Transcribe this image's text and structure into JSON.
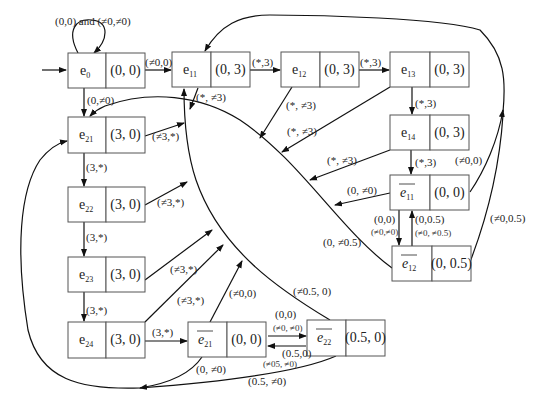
{
  "states": {
    "e0": {
      "name": "e",
      "sub": "0",
      "bar": false,
      "value": "(0, 0)"
    },
    "e11": {
      "name": "e",
      "sub": "11",
      "bar": false,
      "value": "(0, 3)"
    },
    "e12": {
      "name": "e",
      "sub": "12",
      "bar": false,
      "value": "(0, 3)"
    },
    "e13": {
      "name": "e",
      "sub": "13",
      "bar": false,
      "value": "(0, 3)"
    },
    "e14": {
      "name": "e",
      "sub": "14",
      "bar": false,
      "value": "(0, 3)"
    },
    "eb11": {
      "name": "e",
      "sub": "11",
      "bar": true,
      "value": "(0, 0)"
    },
    "eb12": {
      "name": "e",
      "sub": "12",
      "bar": true,
      "value": "(0, 0.5)"
    },
    "e21": {
      "name": "e",
      "sub": "21",
      "bar": false,
      "value": "(3, 0)"
    },
    "e22": {
      "name": "e",
      "sub": "22",
      "bar": false,
      "value": "(3, 0)"
    },
    "e23": {
      "name": "e",
      "sub": "23",
      "bar": false,
      "value": "(3, 0)"
    },
    "e24": {
      "name": "e",
      "sub": "24",
      "bar": false,
      "value": "(3, 0)"
    },
    "eb21": {
      "name": "e",
      "sub": "21",
      "bar": true,
      "value": "(0, 0)"
    },
    "eb22": {
      "name": "e",
      "sub": "22",
      "bar": true,
      "value": "(0.5, 0)"
    }
  },
  "edges": {
    "e0_self": "(0,0) and (≠0,≠0)",
    "e0_e11": "(≠0,0)",
    "e0_e21": "(0,≠0)",
    "e11_e12": "(*,3)",
    "e11_down": "(*, ≠3)",
    "e12_e13": "(*,3)",
    "e12_down": "(*, ≠3)",
    "e13_down": "(*, ≠3)",
    "e13_e14": "(*,3)",
    "e14_down": "(*, ≠3)",
    "e14_eb11": "(*,3)",
    "eb11_left": "(0, ≠0)",
    "eb11_up": "(≠0,0)",
    "eb11_eb12_a": "(0,0)",
    "eb11_eb12_b": "(≠0,≠0)",
    "eb12_eb11_a": "(0,0.5)",
    "eb12_eb11_b": "(≠0, ≠0.5)",
    "eb12_up": "(≠0,0.5)",
    "eb12_left": "(0, ≠0.5)",
    "e21_e22": "(3,*)",
    "e21_right": "(≠3,*)",
    "e22_e23": "(3,*)",
    "e22_right": "(≠3,*)",
    "e23_e24": "(3,*)",
    "e23_right": "(≠3,*)",
    "e24_right": "(≠3,*)",
    "e24_eb21": "(3,*)",
    "eb21_up": "(≠0,0)",
    "eb21_down": "(0, ≠0)",
    "eb21_eb22_a": "(0,0)",
    "eb21_eb22_b": "(≠0, ≠0)",
    "eb22_eb21_a": "(0.5,0)",
    "eb22_eb21_b": "(≠05, ≠0)",
    "eb22_up": "(≠0.5, 0)",
    "eb22_down": "(0.5, ≠0)"
  }
}
